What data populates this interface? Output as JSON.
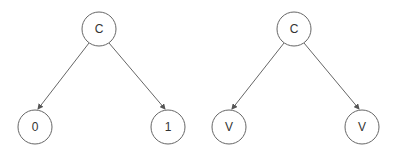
{
  "trees": [
    {
      "root": {
        "label": "C",
        "x": 99,
        "y": 29
      },
      "children": [
        {
          "label": "0",
          "x": 35,
          "y": 127
        },
        {
          "label": "1",
          "x": 168,
          "y": 127
        }
      ]
    },
    {
      "root": {
        "label": "C",
        "x": 294,
        "y": 29
      },
      "children": [
        {
          "label": "V",
          "x": 229,
          "y": 127
        },
        {
          "label": "V",
          "x": 362,
          "y": 127
        }
      ]
    }
  ],
  "style": {
    "node_radius": 17,
    "stroke": "#666666",
    "fill": "#ffffff"
  }
}
